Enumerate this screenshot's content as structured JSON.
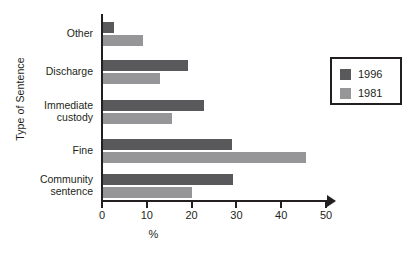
{
  "chart_data": {
    "type": "bar",
    "orientation": "horizontal",
    "title": "",
    "xlabel": "%",
    "ylabel": "Type of Sentence",
    "xlim": [
      0,
      50
    ],
    "xticks": [
      0,
      10,
      20,
      30,
      40,
      50
    ],
    "xtick_labels": [
      "0",
      "10",
      "20",
      "30",
      "40",
      "50"
    ],
    "grid": false,
    "legend_position": "right",
    "categories": [
      "Other",
      "Discharge",
      "Immediate custody",
      "Fine",
      "Community sentence"
    ],
    "category_lines": [
      [
        "Other"
      ],
      [
        "Discharge"
      ],
      [
        "Immediate",
        "custody"
      ],
      [
        "Fine"
      ],
      [
        "Community",
        "sentence"
      ]
    ],
    "series": [
      {
        "name": "1996",
        "color": "#59595b",
        "values": [
          2.5,
          19,
          22.5,
          28.8,
          29
        ]
      },
      {
        "name": "1981",
        "color": "#969698",
        "values": [
          9,
          12.7,
          15.4,
          45.3,
          19.8
        ]
      }
    ]
  },
  "legend": {
    "items": [
      {
        "label": "1996",
        "color": "#59595b"
      },
      {
        "label": "1981",
        "color": "#969698"
      }
    ]
  },
  "axes": {
    "y_title": "Type of Sentence",
    "x_title": "%"
  }
}
